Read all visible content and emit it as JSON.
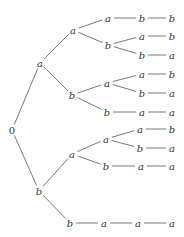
{
  "diagram": {
    "type": "tree",
    "orientation": "left-to-right",
    "root": "0",
    "nodes": [
      {
        "id": "n0",
        "label": "0",
        "x": 12,
        "y": 130
      },
      {
        "id": "n1",
        "label": "a",
        "x": 40,
        "y": 63
      },
      {
        "id": "n2",
        "label": "b",
        "x": 39,
        "y": 191
      },
      {
        "id": "n3",
        "label": "a",
        "x": 73,
        "y": 30
      },
      {
        "id": "n4",
        "label": "b",
        "x": 72,
        "y": 95
      },
      {
        "id": "n5",
        "label": "a",
        "x": 72,
        "y": 154
      },
      {
        "id": "n6",
        "label": "b",
        "x": 70,
        "y": 223
      },
      {
        "id": "n7",
        "label": "a",
        "x": 108,
        "y": 18
      },
      {
        "id": "n8",
        "label": "b",
        "x": 108,
        "y": 45
      },
      {
        "id": "n9",
        "label": "a",
        "x": 107,
        "y": 83
      },
      {
        "id": "n10",
        "label": "b",
        "x": 107,
        "y": 112
      },
      {
        "id": "n11",
        "label": "a",
        "x": 106,
        "y": 139
      },
      {
        "id": "n12",
        "label": "b",
        "x": 106,
        "y": 166
      },
      {
        "id": "n13",
        "label": "a",
        "x": 104,
        "y": 223
      },
      {
        "id": "n14",
        "label": "b",
        "x": 142,
        "y": 18
      },
      {
        "id": "n15",
        "label": "a",
        "x": 142,
        "y": 36
      },
      {
        "id": "n16",
        "label": "b",
        "x": 142,
        "y": 55
      },
      {
        "id": "n17",
        "label": "a",
        "x": 142,
        "y": 74
      },
      {
        "id": "n18",
        "label": "b",
        "x": 142,
        "y": 93
      },
      {
        "id": "n19",
        "label": "a",
        "x": 142,
        "y": 112
      },
      {
        "id": "n20",
        "label": "a",
        "x": 140,
        "y": 129
      },
      {
        "id": "n21",
        "label": "b",
        "x": 140,
        "y": 148
      },
      {
        "id": "n22",
        "label": "a",
        "x": 141,
        "y": 166
      },
      {
        "id": "n23",
        "label": "a",
        "x": 138,
        "y": 223
      },
      {
        "id": "n24",
        "label": "b",
        "x": 172,
        "y": 18
      },
      {
        "id": "n25",
        "label": "b",
        "x": 172,
        "y": 36
      },
      {
        "id": "n26",
        "label": "a",
        "x": 172,
        "y": 55
      },
      {
        "id": "n27",
        "label": "b",
        "x": 172,
        "y": 74
      },
      {
        "id": "n28",
        "label": "a",
        "x": 172,
        "y": 93
      },
      {
        "id": "n29",
        "label": "a",
        "x": 172,
        "y": 112
      },
      {
        "id": "n30",
        "label": "b",
        "x": 172,
        "y": 129
      },
      {
        "id": "n31",
        "label": "a",
        "x": 172,
        "y": 148
      },
      {
        "id": "n32",
        "label": "a",
        "x": 172,
        "y": 166
      },
      {
        "id": "n33",
        "label": "a",
        "x": 172,
        "y": 223
      }
    ],
    "edges": [
      [
        "n0",
        "n1"
      ],
      [
        "n0",
        "n2"
      ],
      [
        "n1",
        "n3"
      ],
      [
        "n1",
        "n4"
      ],
      [
        "n2",
        "n5"
      ],
      [
        "n2",
        "n6"
      ],
      [
        "n3",
        "n7"
      ],
      [
        "n3",
        "n8"
      ],
      [
        "n4",
        "n9"
      ],
      [
        "n4",
        "n10"
      ],
      [
        "n5",
        "n11"
      ],
      [
        "n5",
        "n12"
      ],
      [
        "n6",
        "n13"
      ],
      [
        "n7",
        "n14"
      ],
      [
        "n8",
        "n15"
      ],
      [
        "n8",
        "n16"
      ],
      [
        "n9",
        "n17"
      ],
      [
        "n9",
        "n18"
      ],
      [
        "n10",
        "n19"
      ],
      [
        "n11",
        "n20"
      ],
      [
        "n11",
        "n21"
      ],
      [
        "n12",
        "n22"
      ],
      [
        "n13",
        "n23"
      ],
      [
        "n14",
        "n24"
      ],
      [
        "n15",
        "n25"
      ],
      [
        "n16",
        "n26"
      ],
      [
        "n17",
        "n27"
      ],
      [
        "n18",
        "n28"
      ],
      [
        "n19",
        "n29"
      ],
      [
        "n20",
        "n30"
      ],
      [
        "n21",
        "n31"
      ],
      [
        "n22",
        "n32"
      ],
      [
        "n23",
        "n33"
      ]
    ],
    "leaf_sequences": [
      "a a a b b",
      "a a b a b",
      "a a b b a",
      "a b a a b",
      "a b a b a",
      "a b b a a",
      "b a a a b",
      "b a a b a",
      "b a b a a",
      "b b a a a"
    ]
  }
}
